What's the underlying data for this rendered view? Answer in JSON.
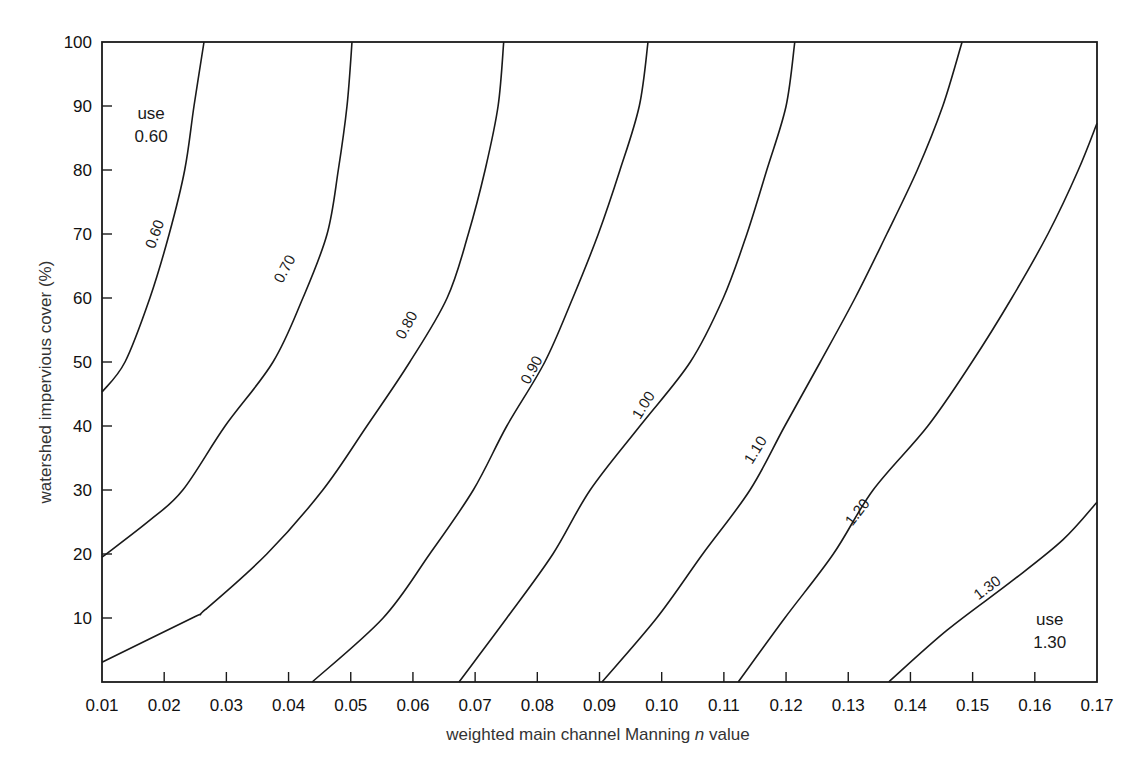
{
  "chart_data": {
    "type": "line",
    "title": "",
    "xlabel": "weighted main channel Manning n value",
    "xlabel_parts": {
      "before": "weighted main channel Manning ",
      "italic": "n",
      "after": " value"
    },
    "ylabel": "watershed impervious cover (%)",
    "xlim": [
      0.01,
      0.17
    ],
    "ylim": [
      0,
      100
    ],
    "grid": false,
    "legend": "none (curves labeled inline)",
    "x_ticks": [
      "0.01",
      "0.02",
      "0.03",
      "0.04",
      "0.05",
      "0.06",
      "0.07",
      "0.08",
      "0.09",
      "0.10",
      "0.11",
      "0.12",
      "0.13",
      "0.14",
      "0.15",
      "0.16",
      "0.17"
    ],
    "y_ticks": [
      "10",
      "20",
      "30",
      "40",
      "50",
      "60",
      "70",
      "80",
      "90",
      "100"
    ],
    "series": [
      {
        "name": "0.60",
        "label_pos": [
          0.0184,
          70.0
        ],
        "label_rot": -70,
        "points": [
          [
            0.01,
            45.3
          ],
          [
            0.0137,
            50
          ],
          [
            0.0177,
            60
          ],
          [
            0.0208,
            70
          ],
          [
            0.0233,
            80
          ],
          [
            0.0248,
            90
          ],
          [
            0.0264,
            100
          ]
        ]
      },
      {
        "name": "0.70",
        "label_pos": [
          0.0393,
          64.6
        ],
        "label_rot": -62,
        "points": [
          [
            0.01,
            19.5
          ],
          [
            0.0177,
            25.3
          ],
          [
            0.023,
            30
          ],
          [
            0.0298,
            40
          ],
          [
            0.0375,
            50
          ],
          [
            0.0423,
            60
          ],
          [
            0.0462,
            70
          ],
          [
            0.048,
            80
          ],
          [
            0.0494,
            90
          ],
          [
            0.0502,
            100
          ]
        ]
      },
      {
        "name": "0.80",
        "label_pos": [
          0.0589,
          55.8
        ],
        "label_rot": -62,
        "points": [
          [
            0.01,
            3.1
          ],
          [
            0.0245,
            10
          ],
          [
            0.0266,
            11.3
          ],
          [
            0.0365,
            20
          ],
          [
            0.0455,
            30
          ],
          [
            0.0526,
            40
          ],
          [
            0.0595,
            50
          ],
          [
            0.0655,
            60
          ],
          [
            0.0689,
            70
          ],
          [
            0.0716,
            80
          ],
          [
            0.0737,
            90
          ],
          [
            0.0746,
            100
          ]
        ]
      },
      {
        "name": "0.90",
        "label_pos": [
          0.079,
          48.8
        ],
        "label_rot": -62,
        "points": [
          [
            0.0438,
            0
          ],
          [
            0.0552,
            10
          ],
          [
            0.0627,
            20
          ],
          [
            0.0697,
            30
          ],
          [
            0.0751,
            40
          ],
          [
            0.0812,
            50
          ],
          [
            0.0857,
            60
          ],
          [
            0.0898,
            70
          ],
          [
            0.0933,
            80
          ],
          [
            0.0964,
            90
          ],
          [
            0.0978,
            100
          ]
        ]
      },
      {
        "name": "1.00",
        "label_pos": [
          0.097,
          43.3
        ],
        "label_rot": -58,
        "points": [
          [
            0.0674,
            0
          ],
          [
            0.0751,
            10
          ],
          [
            0.0825,
            20
          ],
          [
            0.0885,
            30
          ],
          [
            0.0965,
            40
          ],
          [
            0.1046,
            50
          ],
          [
            0.1099,
            60
          ],
          [
            0.1137,
            70
          ],
          [
            0.1169,
            80
          ],
          [
            0.12,
            90
          ],
          [
            0.1214,
            100
          ]
        ]
      },
      {
        "name": "1.10",
        "label_pos": [
          0.115,
          36.3
        ],
        "label_rot": -58,
        "points": [
          [
            0.0904,
            0
          ],
          [
            0.0992,
            10
          ],
          [
            0.1066,
            20
          ],
          [
            0.1142,
            30
          ],
          [
            0.1198,
            40
          ],
          [
            0.1255,
            50
          ],
          [
            0.1311,
            60
          ],
          [
            0.1362,
            70
          ],
          [
            0.1411,
            80
          ],
          [
            0.1452,
            90
          ],
          [
            0.1483,
            100
          ]
        ]
      },
      {
        "name": "1.20",
        "label_pos": [
          0.1314,
          26.6
        ],
        "label_rot": -52,
        "points": [
          [
            0.1123,
            0
          ],
          [
            0.1198,
            10
          ],
          [
            0.1276,
            20
          ],
          [
            0.134,
            30
          ],
          [
            0.1428,
            40
          ],
          [
            0.1499,
            50
          ],
          [
            0.1563,
            60
          ],
          [
            0.1621,
            70
          ],
          [
            0.167,
            80
          ],
          [
            0.17,
            87.3
          ]
        ]
      },
      {
        "name": "1.30",
        "label_pos": [
          0.1523,
          14.8
        ],
        "label_rot": -37,
        "points": [
          [
            0.1365,
            0
          ],
          [
            0.1459,
            8.1
          ],
          [
            0.1565,
            15.9
          ],
          [
            0.1645,
            22.2
          ],
          [
            0.17,
            28.1
          ]
        ]
      }
    ],
    "annotations": [
      {
        "lines": [
          "use",
          "0.60"
        ],
        "pos": [
          0.0179,
          88.0
        ]
      },
      {
        "lines": [
          "use",
          "1.30"
        ],
        "pos": [
          0.1624,
          8.9
        ]
      }
    ]
  }
}
